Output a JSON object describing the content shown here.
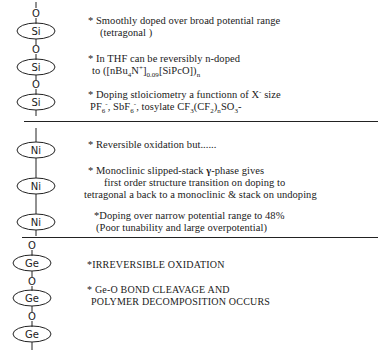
{
  "figure": {
    "sections": [
      {
        "metal": "Si",
        "bridge": "O",
        "notes": [
          {
            "lines": [
              "* Smoothly doped over broad potential range",
              "(tetragonal )"
            ]
          },
          {
            "lines": [
              "* In THF can be reversibly n-doped",
              "to ([nBu",
              "4",
              "N",
              "+",
              "]",
              "0.09",
              "[SiPcO])",
              "n"
            ]
          },
          {
            "lines": [
              "* Doping stloiciometry a functionn of X",
              "-",
              " size",
              "PF",
              "6",
              "-",
              ", SbF",
              "6",
              "-",
              ", tosylate  CF",
              "3",
              "(CF",
              "2",
              ")",
              "n",
              "SO",
              "3",
              "-"
            ]
          }
        ]
      },
      {
        "metal": "Ni",
        "bridge": "",
        "notes": [
          {
            "lines": [
              "* Reversible oxidation but......"
            ]
          },
          {
            "lines": [
              "* Monoclinic slipped-stack ",
              "γ",
              "-phase gives",
              "first order structure transition on doping to",
              "tetragonal a back to a monoclinic & stack on undoping"
            ]
          },
          {
            "lines": [
              "*Doping over narrow potential range to 48%",
              "(Poor tunability and large overpotential)"
            ]
          }
        ]
      },
      {
        "metal": "Ge",
        "bridge": "O",
        "notes": [
          {
            "lines": [
              "*IRREVERSIBLE OXIDATION"
            ]
          },
          {
            "lines": [
              "* Ge-O BOND CLEAVAGE AND",
              "POLYMER DECOMPOSITION OCCURS"
            ]
          }
        ]
      }
    ],
    "colors": {
      "ink": "#1a1a1a",
      "background": "#ffffff"
    }
  }
}
